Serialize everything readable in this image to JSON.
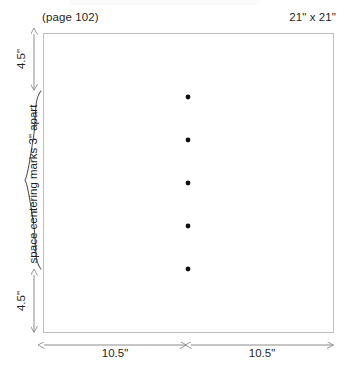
{
  "diagram": {
    "page_label": "(page 102)",
    "size_label": "21\" x 21\"",
    "sheet": {
      "name": "fabric-square",
      "width_in": 21,
      "height_in": 21
    },
    "dimensions": {
      "top_margin": "4.5\"",
      "bottom_margin": "4.5\"",
      "left_half_width": "10.5\"",
      "right_half_width": "10.5\""
    },
    "brace": {
      "label": "space centering marks 3\" apart",
      "spacing_in": 3,
      "mark_count": 5
    },
    "centering_marks": [
      {
        "name": "centering-mark-1",
        "x": 188,
        "y": 97
      },
      {
        "name": "centering-mark-2",
        "x": 188,
        "y": 140
      },
      {
        "name": "centering-mark-3",
        "x": 188,
        "y": 183
      },
      {
        "name": "centering-mark-4",
        "x": 188,
        "y": 226
      },
      {
        "name": "centering-mark-5",
        "x": 188,
        "y": 269
      }
    ],
    "colors": {
      "sheet_border": "#bfbfbf",
      "guide_line": "#8c8c8c",
      "mark_fill": "#111111",
      "text": "#1f1f1f",
      "background": "#ffffff"
    }
  }
}
